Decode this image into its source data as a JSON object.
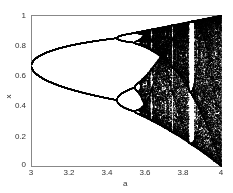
{
  "chart_data": {
    "type": "scatter",
    "title": "",
    "xlabel": "a",
    "ylabel": "x",
    "xlim": [
      3,
      4
    ],
    "ylim": [
      0,
      1
    ],
    "xticks": [
      "3",
      "3.2",
      "3.4",
      "3.6",
      "3.8",
      "4"
    ],
    "yticks": [
      "0",
      "0.2",
      "0.4",
      "0.6",
      "0.8",
      "1"
    ],
    "grid": false,
    "legend": null,
    "features": {
      "period_doubling_1": 3.0,
      "period_doubling_2": 3.449,
      "onset_of_chaos": 3.57,
      "period_3_window": 3.83,
      "x_at_a3": 0.667,
      "x_range_at_a4": [
        0,
        1
      ]
    }
  },
  "render": {
    "plot_left": 31,
    "plot_right": 221,
    "plot_top": 15,
    "plot_bottom": 166,
    "point_color": "#000000",
    "axis_color": "#888888"
  }
}
